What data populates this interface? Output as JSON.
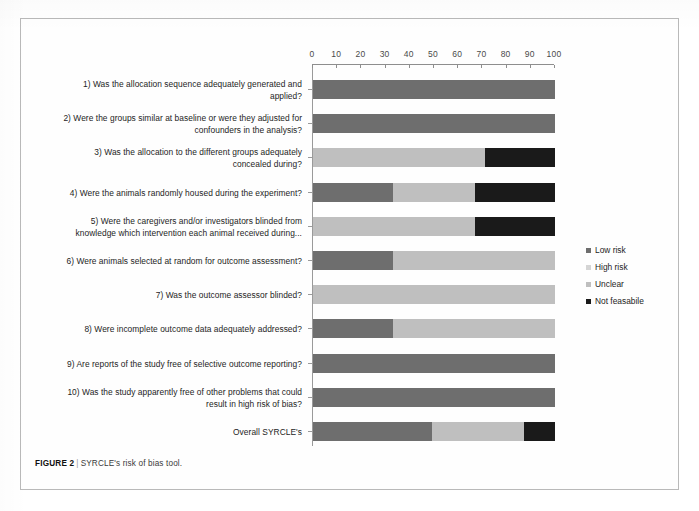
{
  "figure": {
    "caption_label": "FIGURE 2",
    "caption_separator": "|",
    "caption_text": "SYRCLE's risk of bias tool."
  },
  "legend": {
    "position": "right",
    "items": [
      {
        "label": "Low risk",
        "color": "#6e6e6e"
      },
      {
        "label": "High risk",
        "color": "#d5d5d5"
      },
      {
        "label": "Unclear",
        "color": "#bfbfbf"
      },
      {
        "label": "Not feasabile",
        "color": "#1a1a1a"
      }
    ]
  },
  "chart_data": {
    "type": "bar",
    "orientation": "horizontal",
    "stacked": true,
    "percent": true,
    "title": "",
    "xlabel": "",
    "ylabel": "",
    "xlim": [
      0,
      100
    ],
    "xticks": [
      0,
      10,
      20,
      30,
      40,
      50,
      60,
      70,
      80,
      90,
      100
    ],
    "xtick_labels": [
      "0",
      "10",
      "20",
      "30",
      "40",
      "50",
      "60",
      "70",
      "80",
      "90",
      "100"
    ],
    "grid": false,
    "legend_position": "right",
    "categories": [
      "1) Was the allocation sequence adequately generated and applied?",
      "2) Were the groups similar at baseline or were they adjusted for confounders in the analysis?",
      "3) Was the allocation to the different groups adequately concealed during?",
      "4) Were the animals randomly housed during the experiment?",
      "5) Were the caregivers and/or investigators blinded from knowledge which intervention each animal received during...",
      "6) Were animals selected at random for outcome assessment?",
      "7) Was the outcome assessor blinded?",
      "8) Were incomplete outcome data adequately addressed?",
      "9) Are reports of the study free of selective outcome reporting?",
      "10) Was the study apparently free of other problems that could result in high risk of bias?",
      "Overall SYRCLE's"
    ],
    "series": [
      {
        "name": "Low risk",
        "color": "#6e6e6e",
        "values": [
          100,
          100,
          0,
          33,
          0,
          33,
          0,
          33,
          100,
          100,
          49
        ]
      },
      {
        "name": "High risk",
        "color": "#d5d5d5",
        "values": [
          0,
          0,
          0,
          0,
          0,
          0,
          0,
          0,
          0,
          0,
          0
        ]
      },
      {
        "name": "Unclear",
        "color": "#bfbfbf",
        "values": [
          0,
          0,
          71,
          34,
          67,
          67,
          100,
          67,
          0,
          0,
          38
        ]
      },
      {
        "name": "Not feasabile",
        "color": "#1a1a1a",
        "values": [
          0,
          0,
          29,
          33,
          33,
          0,
          0,
          0,
          0,
          0,
          13
        ]
      }
    ]
  }
}
